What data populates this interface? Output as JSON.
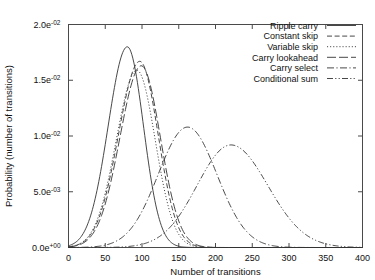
{
  "chart_data": {
    "type": "line",
    "title": "",
    "xlabel": "Number of transitions",
    "ylabel": "Probability (number of transitions)",
    "xlim": [
      0,
      400
    ],
    "ylim": [
      0,
      0.02
    ],
    "grid": false,
    "legend_position": "top-right",
    "xticks": [
      0,
      50,
      100,
      150,
      200,
      250,
      300,
      350,
      400
    ],
    "xtick_labels": [
      "0",
      "50",
      "100",
      "150",
      "200",
      "250",
      "300",
      "350",
      "400"
    ],
    "yticks": [
      0,
      0.005,
      0.01,
      0.015,
      0.02
    ],
    "ytick_labels": [
      "0.0e+00",
      "5.0e-03",
      "1.0e-02",
      "1.5e-02",
      "2.0e-02"
    ],
    "ytick_mantissas": [
      "0.0e",
      "5.0e",
      "1.0e",
      "1.5e",
      "2.0e"
    ],
    "ytick_exponents": [
      "+00",
      "-03",
      "-02",
      "-02",
      "-02"
    ],
    "series": [
      {
        "name": "Ripple carry",
        "dash": "solid",
        "peak_x": 80,
        "peak_y": 0.018,
        "sigma_left": 26,
        "sigma_right": 22
      },
      {
        "name": "Constant skip",
        "dash": "dashed",
        "peak_x": 97,
        "peak_y": 0.0167,
        "sigma_left": 29,
        "sigma_right": 25
      },
      {
        "name": "Variable skip",
        "dash": "dotted",
        "peak_x": 93,
        "peak_y": 0.0159,
        "sigma_left": 28,
        "sigma_right": 25
      },
      {
        "name": "Carry lookahead",
        "dash": "longdash",
        "peak_x": 99,
        "peak_y": 0.0163,
        "sigma_left": 29,
        "sigma_right": 26
      },
      {
        "name": "Carry select",
        "dash": "dashdot",
        "peak_x": 162,
        "peak_y": 0.0108,
        "sigma_left": 40,
        "sigma_right": 40
      },
      {
        "name": "Conditional sum",
        "dash": "dashdotdot",
        "peak_x": 221,
        "peak_y": 0.0092,
        "sigma_left": 46,
        "sigma_right": 50
      }
    ]
  },
  "legend": {
    "items": [
      {
        "label": "Ripple carry"
      },
      {
        "label": "Constant skip"
      },
      {
        "label": "Variable skip"
      },
      {
        "label": "Carry lookahead"
      },
      {
        "label": "Carry select"
      },
      {
        "label": "Conditional sum"
      }
    ]
  }
}
